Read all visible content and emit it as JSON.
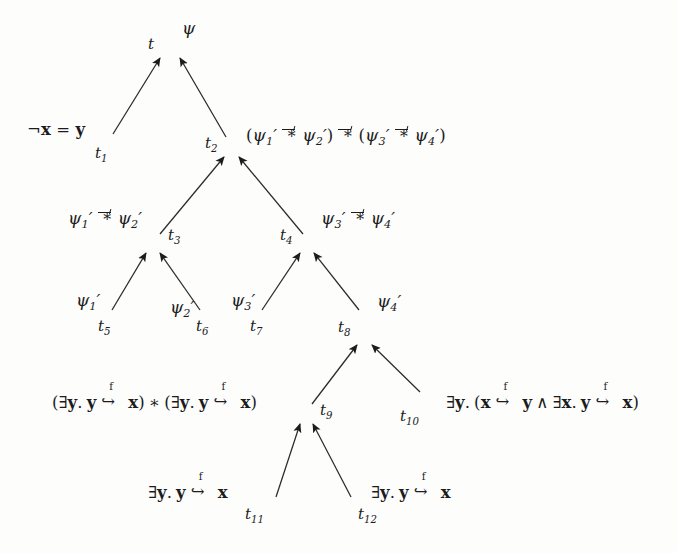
{
  "diagram": {
    "type": "proof-tree",
    "background_color": "#fdfdfc",
    "ink_color": "#1c1c1c",
    "width": 677,
    "height": 553,
    "symbols": {
      "magic_wand": "-*",
      "separating_conjunction": "*",
      "points_to_field": "f",
      "exists": "∃",
      "and": "∧",
      "not": "¬",
      "psi": "ψ",
      "prime": "′"
    },
    "nodes": [
      {
        "id": "t",
        "name": "t",
        "x": 168,
        "y": 47,
        "label": "t",
        "formula_parts": [
          "psi"
        ],
        "formula_text": "ψ",
        "formula_x": 182,
        "formula_y": 26,
        "label_x": 148,
        "label_y": 40
      },
      {
        "id": "t1",
        "name": "t1",
        "x": 104,
        "y": 144,
        "label": "t",
        "sub": "1",
        "formula_text": "¬x = y",
        "formula_x": 27,
        "formula_y": 128,
        "label_x": 95,
        "label_y": 148
      },
      {
        "id": "t2",
        "name": "t2",
        "x": 231,
        "y": 146,
        "label": "t",
        "sub": "2",
        "formula_text": "(ψ′1 -* ψ′2) -* (ψ′3 -* ψ′4)",
        "formula_x": 246,
        "formula_y": 129,
        "label_x": 205,
        "label_y": 139
      },
      {
        "id": "t3",
        "name": "t3",
        "x": 152,
        "y": 243,
        "label": "t",
        "sub": "3",
        "formula_text": "ψ′1 -* ψ′2",
        "formula_x": 68,
        "formula_y": 210,
        "label_x": 168,
        "label_y": 231
      },
      {
        "id": "t4",
        "name": "t4",
        "x": 307,
        "y": 243,
        "label": "t",
        "sub": "4",
        "formula_text": "ψ′3 -* ψ′4",
        "formula_x": 321,
        "formula_y": 210,
        "label_x": 280,
        "label_y": 231
      },
      {
        "id": "t5",
        "name": "t5",
        "x": 108,
        "y": 318,
        "label": "t",
        "sub": "5",
        "formula_text": "ψ′1",
        "formula_x": 76,
        "formula_y": 296,
        "label_x": 98,
        "label_y": 322
      },
      {
        "id": "t6",
        "name": "t6",
        "x": 204,
        "y": 318,
        "label": "t",
        "sub": "6",
        "formula_text": "ψ′2",
        "formula_x": 170,
        "formula_y": 302,
        "label_x": 196,
        "label_y": 322
      },
      {
        "id": "t7",
        "name": "t7",
        "x": 257,
        "y": 318,
        "label": "t",
        "sub": "7",
        "formula_text": "ψ′3",
        "formula_x": 231,
        "formula_y": 296,
        "label_x": 250,
        "label_y": 322
      },
      {
        "id": "t8",
        "name": "t8",
        "x": 364,
        "y": 335,
        "label": "t",
        "sub": "8",
        "formula_text": "ψ′4",
        "formula_x": 377,
        "formula_y": 297,
        "label_x": 338,
        "label_y": 323
      },
      {
        "id": "t9",
        "name": "t9",
        "x": 306,
        "y": 413,
        "label": "t",
        "sub": "9",
        "formula_text": "(∃y. y ↪f x) * (∃y. y ↪f x)",
        "formula_x": 52,
        "formula_y": 395,
        "label_x": 320,
        "label_y": 406
      },
      {
        "id": "t10",
        "name": "t10",
        "x": 419,
        "y": 401,
        "label": "t",
        "sub": "10",
        "formula_text": "∃y. (x ↪f y ∧ ∃x. y ↪f x)",
        "formula_x": 411,
        "formula_y": 396,
        "label_x": 400,
        "label_y": 412
      },
      {
        "id": "t11",
        "name": "t11",
        "x": 270,
        "y": 506,
        "label": "t",
        "sub": "11",
        "formula_text": "∃y. y ↪f x",
        "formula_x": 148,
        "formula_y": 485,
        "label_x": 245,
        "label_y": 510
      },
      {
        "id": "t12",
        "name": "t12",
        "x": 356,
        "y": 506,
        "label": "t",
        "sub": "12",
        "formula_text": "∃y. y ↪f x",
        "formula_x": 371,
        "formula_y": 485,
        "label_x": 358,
        "label_y": 510
      }
    ],
    "edges": [
      {
        "from": "t1",
        "to": "t",
        "x1": 113,
        "y1": 134,
        "x2": 160,
        "y2": 58
      },
      {
        "from": "t2",
        "to": "t",
        "x1": 226,
        "y1": 137,
        "x2": 180,
        "y2": 58
      },
      {
        "from": "t3",
        "to": "t2",
        "x1": 160,
        "y1": 234,
        "x2": 224,
        "y2": 157
      },
      {
        "from": "t4",
        "to": "t2",
        "x1": 303,
        "y1": 234,
        "x2": 239,
        "y2": 157
      },
      {
        "from": "t5",
        "to": "t3",
        "x1": 112,
        "y1": 310,
        "x2": 146,
        "y2": 253
      },
      {
        "from": "t6",
        "to": "t3",
        "x1": 200,
        "y1": 310,
        "x2": 160,
        "y2": 253
      },
      {
        "from": "t7",
        "to": "t4",
        "x1": 262,
        "y1": 310,
        "x2": 300,
        "y2": 253
      },
      {
        "from": "t8",
        "to": "t4",
        "x1": 359,
        "y1": 310,
        "x2": 314,
        "y2": 253
      },
      {
        "from": "t9",
        "to": "t8",
        "x1": 312,
        "y1": 404,
        "x2": 357,
        "y2": 345
      },
      {
        "from": "t10",
        "to": "t8",
        "x1": 420,
        "y1": 392,
        "x2": 372,
        "y2": 345
      },
      {
        "from": "t11",
        "to": "t9",
        "x1": 276,
        "y1": 497,
        "x2": 300,
        "y2": 424
      },
      {
        "from": "t12",
        "to": "t9",
        "x1": 351,
        "y1": 497,
        "x2": 313,
        "y2": 424
      }
    ]
  }
}
